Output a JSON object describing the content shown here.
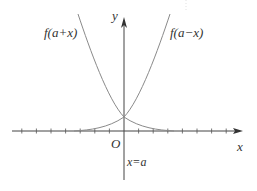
{
  "diagram": {
    "title": "",
    "labels": {
      "y_axis": "y",
      "x_axis": "x",
      "origin": "O",
      "symmetry_line": "x=a",
      "left_curve": "f(a+x)",
      "right_curve": "f(a−x)"
    },
    "colors": {
      "axis": "#444444",
      "curve": "#8a8a8a",
      "text": "#333333",
      "background": "#ffffff"
    },
    "geometry": {
      "origin_px": [
        124,
        131
      ],
      "x_axis_range_px": [
        12,
        243
      ],
      "y_axis_range_px": [
        18,
        180
      ],
      "tick_spacing_px": 14.6,
      "ticks_left": 7,
      "ticks_right": 7,
      "curve_intersection_px": [
        124,
        117
      ]
    },
    "curves": [
      {
        "name": "f(a+x)",
        "shape": "decreasing exponential-like, steep left, flattening to x-axis on right"
      },
      {
        "name": "f(a−x)",
        "shape": "increasing exponential-like, flat on left, steep on right"
      }
    ]
  }
}
